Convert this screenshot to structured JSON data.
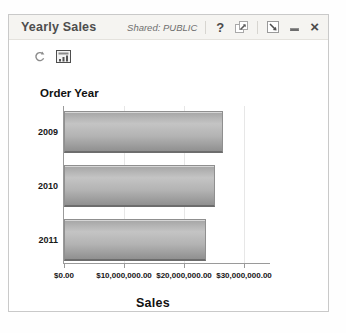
{
  "window": {
    "title": "Yearly Sales",
    "shared_label": "Shared: PUBLIC",
    "controls": {
      "help": "?",
      "close": "×"
    },
    "icons": {
      "help": "question-mark-icon",
      "popout": "popout-window-icon",
      "resize": "resize-arrow-icon",
      "minimize": "minimize-dash-icon",
      "close": "close-x-icon"
    }
  },
  "toolbar": {
    "icons": [
      {
        "name": "refresh-icon"
      },
      {
        "name": "chart-view-icon"
      }
    ]
  },
  "chart_data": {
    "type": "bar",
    "orientation": "horizontal",
    "title": "",
    "ylabel": "Order Year",
    "xlabel": "Sales",
    "categories": [
      "2009",
      "2010",
      "2011"
    ],
    "values": [
      26500000,
      25200000,
      23700000
    ],
    "x_ticks": [
      {
        "value": 0,
        "label": "$0.00"
      },
      {
        "value": 10000000,
        "label": "$10,000,000.00"
      },
      {
        "value": 20000000,
        "label": "$20,000,000.00"
      },
      {
        "value": 30000000,
        "label": "$30,000,000.00"
      }
    ],
    "xlim": [
      0,
      34300000
    ],
    "grid": "vertical",
    "legend": "none",
    "bar_color": "#b3b3b3"
  },
  "colors": {
    "bar_fill": "#b3b3b3",
    "bar_border": "#6d6d6d",
    "axis": "#9a9a9a",
    "gridline": "#e7e7e7",
    "titlebar_bg": "#f5f4f1",
    "window_border": "#c9c9c9"
  }
}
